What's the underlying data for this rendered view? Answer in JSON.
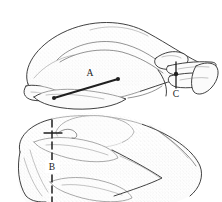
{
  "figure": {
    "background_color": "#ffffff",
    "ink_color": "#2b2b2b",
    "panels": [
      {
        "id": "panel-top",
        "name": "whole-roasted-bird-side-view",
        "description": "Side view of a whole roasted bird resting on its side with leg and wing visible at right",
        "markers": [
          "A",
          "C"
        ]
      },
      {
        "id": "panel-bottom",
        "name": "carved-bird-sliced-view",
        "description": "Partially carved bird showing sliced breast sections with vertical cut line",
        "markers": [
          "B"
        ]
      }
    ],
    "labels": [
      {
        "id": "label-a",
        "text": "A",
        "x": 90,
        "y": 76,
        "leader": "diagonal-line-lower-left-to-upper-right",
        "panel": "panel-top"
      },
      {
        "id": "label-c",
        "text": "C",
        "x": 176,
        "y": 97,
        "leader": "short-vertical-line-above",
        "panel": "panel-top"
      },
      {
        "id": "label-b",
        "text": "B",
        "x": 52,
        "y": 168,
        "leader": "vertical-dashed-line-through-label",
        "panel": "panel-bottom"
      }
    ]
  }
}
